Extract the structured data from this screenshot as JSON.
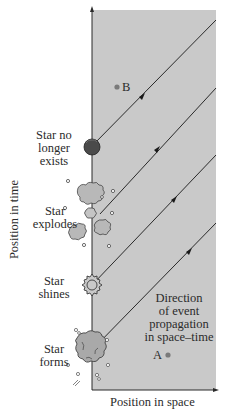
{
  "diagram": {
    "axes": {
      "x_label": "Position in space",
      "y_label": "Position in time"
    },
    "stages": [
      {
        "label_lines": [
          "Star no",
          "longer",
          "exists"
        ],
        "icon": "dark-sphere-icon"
      },
      {
        "label_lines": [
          "Star",
          "explodes"
        ],
        "icon": "explosion-icon"
      },
      {
        "label_lines": [
          "Star",
          "shines"
        ],
        "icon": "shining-star-icon"
      },
      {
        "label_lines": [
          "Star",
          "forms"
        ],
        "icon": "forming-cloud-icon"
      }
    ],
    "annotation": {
      "lines": [
        "Direction",
        "of event",
        "propagation",
        "in space–time"
      ]
    },
    "points": {
      "A": "A",
      "B": "B"
    },
    "colors": {
      "panel_background": "#c9c9c9",
      "line": "#2a2a2a",
      "point": "#7a7a7a",
      "dark_sphere": "#4a4a4a"
    }
  }
}
